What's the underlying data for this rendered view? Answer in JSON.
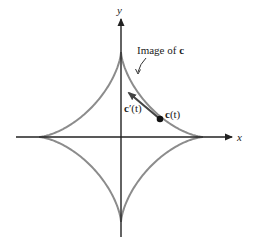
{
  "figure": {
    "type": "astroid parametric curve with tangent vector",
    "axes": {
      "x_label": "x",
      "y_label": "y",
      "origin_px": [
        121,
        137
      ]
    },
    "curve": {
      "name": "astroid",
      "color": "#8c8c8c",
      "rx_px": 82,
      "ry_px": 85
    },
    "labels": {
      "image_label_prefix": "Image of ",
      "image_label_bold": "c",
      "point_label_bold": "c",
      "point_label_suffix": "(t)",
      "tangent_label_bold": "c",
      "tangent_label_suffix": "′(t)"
    },
    "point": {
      "px": [
        160,
        119
      ]
    },
    "tangent_tip": {
      "px": [
        127,
        91
      ]
    },
    "colors": {
      "axis": "#222222",
      "curve": "#8c8c8c",
      "vector": "#333333",
      "text": "#222222"
    }
  }
}
